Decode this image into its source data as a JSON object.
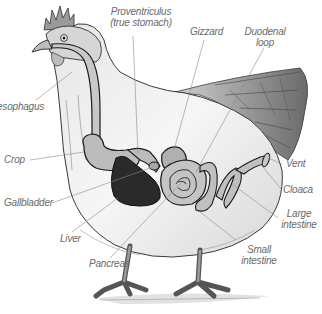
{
  "diagram": {
    "labels": {
      "proventriculus_line1": "Proventriculus",
      "proventriculus_line2": "(true stomach)",
      "gizzard": "Gizzard",
      "duodenal_line1": "Duodenal",
      "duodenal_line2": "loop",
      "esophagus": "esophagus",
      "crop": "Crop",
      "gallbladder": "Gallbladder",
      "liver": "Liver",
      "pancreas": "Pancreas",
      "vent": "Vent",
      "cloaca": "Cloaca",
      "large_intestine_line1": "Large",
      "large_intestine_line2": "intestine",
      "small_intestine_line1": "Small",
      "small_intestine_line2": "intestine"
    },
    "colors": {
      "outline": "#1a1a1a",
      "organ_fill": "#b8b8b8",
      "liver_fill": "#2a2a2a",
      "leader_line": "#8a8a8a",
      "label_text": "#6a6a6a",
      "comb": "#9a9a9a"
    }
  }
}
